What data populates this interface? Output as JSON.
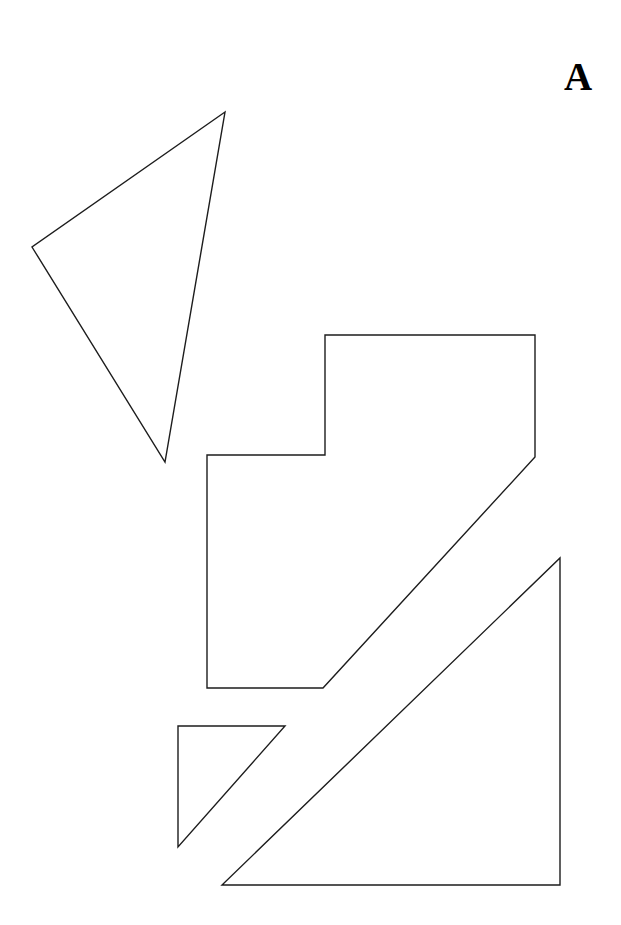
{
  "figure": {
    "panel_label": "A",
    "label_position": {
      "x": 564,
      "y": 57
    },
    "canvas": {
      "width": 621,
      "height": 925
    },
    "background_color": "#ffffff",
    "stroke_color": "#1d1d1d",
    "stroke_width": 1.4
  },
  "shapes": [
    {
      "name": "triangle-upper-left",
      "type": "polygon",
      "points": "225,112 32,247 165,462"
    },
    {
      "name": "notched-polygon-center",
      "type": "polygon",
      "points": "325,335 535,335 535,457 323,688 207,688 207,455 325,455"
    },
    {
      "name": "small-right-triangle-lower-left",
      "type": "polygon",
      "points": "178,726 285,726 178,847"
    },
    {
      "name": "large-right-triangle-lower-right",
      "type": "polygon",
      "points": "560,558 560,885 222,885"
    }
  ]
}
